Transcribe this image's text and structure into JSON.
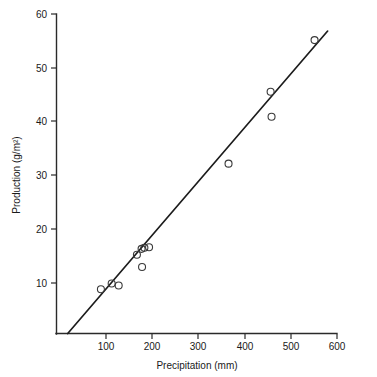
{
  "chart_data": {
    "type": "scatter",
    "title": "",
    "xlabel": "Precipitation  (mm)",
    "ylabel": "Production  (g/m²)",
    "xlim": [
      0,
      600
    ],
    "ylim": [
      0,
      60
    ],
    "grid": false,
    "legend": "none",
    "x_ticks": [
      100,
      200,
      300,
      400,
      500,
      600
    ],
    "x_tick_labels": [
      "100",
      "200",
      "300",
      "400",
      "500",
      "600"
    ],
    "y_ticks": [
      10,
      20,
      30,
      40,
      50,
      60
    ],
    "y_tick_labels": [
      "10",
      "20",
      "30",
      "40",
      "50",
      "60"
    ],
    "marker": "open-circle",
    "x": [
      95,
      118,
      133,
      172,
      182,
      188,
      198,
      183,
      368,
      458,
      460,
      552
    ],
    "y": [
      8.3,
      9.4,
      9.0,
      14.8,
      15.9,
      16.1,
      16.2,
      12.5,
      31.9,
      45.4,
      40.7,
      55.1
    ],
    "points": [
      {
        "x": 95,
        "y": 8.3
      },
      {
        "x": 118,
        "y": 9.4
      },
      {
        "x": 133,
        "y": 9.0
      },
      {
        "x": 172,
        "y": 14.8
      },
      {
        "x": 182,
        "y": 15.9
      },
      {
        "x": 188,
        "y": 16.1
      },
      {
        "x": 198,
        "y": 16.2
      },
      {
        "x": 183,
        "y": 12.5
      },
      {
        "x": 368,
        "y": 31.9
      },
      {
        "x": 458,
        "y": 45.4
      },
      {
        "x": 460,
        "y": 40.7
      },
      {
        "x": 552,
        "y": 55.1
      }
    ],
    "fit_line": {
      "type": "linear-regression",
      "x_start": 24,
      "y_start": 0,
      "x_end": 580,
      "y_end": 56.8
    }
  },
  "axes": {
    "x_title": "Precipitation  (mm)",
    "y_title": "Production  (g/m²)"
  },
  "colors": {
    "axis": "#2a2a2a",
    "line": "#1c1c1c",
    "marker": "#3a3a3a",
    "text": "#1a1a1a",
    "background": "#ffffff"
  }
}
